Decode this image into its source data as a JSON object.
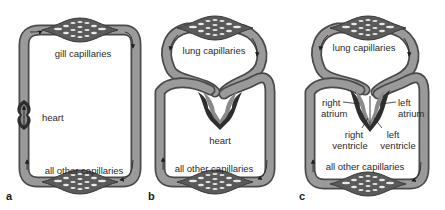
{
  "figure": {
    "panels": [
      {
        "letter": "a",
        "labels": {
          "top_capillaries": "gill capillaries",
          "heart": "heart",
          "bottom_capillaries": "all other capillaries"
        }
      },
      {
        "letter": "b",
        "labels": {
          "top_capillaries": "lung capillaries",
          "heart": "heart",
          "bottom_capillaries": "all other capillaries"
        }
      },
      {
        "letter": "c",
        "labels": {
          "top_capillaries": "lung capillaries",
          "right_atrium_1": "right",
          "right_atrium_2": "atrium",
          "left_atrium_1": "left",
          "left_atrium_2": "atrium",
          "right_ventricle_1": "right",
          "right_ventricle_2": "ventricle",
          "left_ventricle_1": "left",
          "left_ventricle_2": "ventricle",
          "bottom_capillaries": "all other capillaries"
        }
      }
    ],
    "colors": {
      "vessel_outline": "#4a4a4a",
      "vessel_fill": "#9a9a9a",
      "heart_dark": "#2e2e2e",
      "heart_mid": "#777777",
      "capillary_cells": "#e8e8e8",
      "text": "#2a2a2a",
      "background": "#ffffff"
    }
  }
}
